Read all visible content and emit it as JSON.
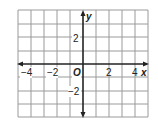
{
  "diagram": {
    "type": "coordinate-grid",
    "grid": {
      "cols": 10,
      "rows": 8,
      "line_color": "#9a9a9a",
      "axis_color": "#222222"
    },
    "x_axis": {
      "label": "x",
      "ticks": [
        "−4",
        "−2",
        "2",
        "4"
      ]
    },
    "y_axis": {
      "label": "y",
      "ticks": [
        "2",
        "−2"
      ]
    },
    "origin_label": "O"
  }
}
